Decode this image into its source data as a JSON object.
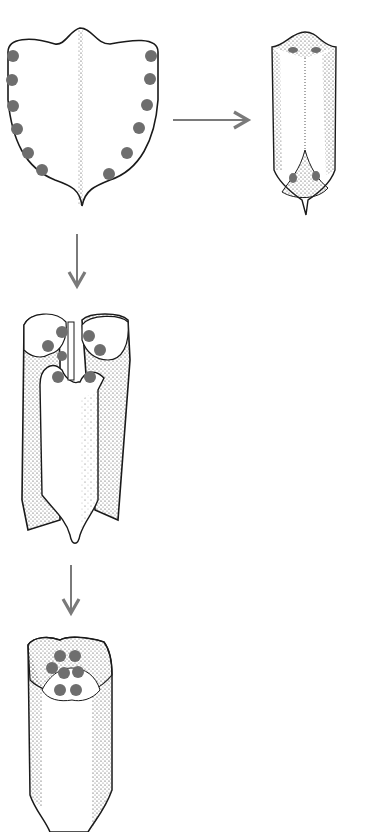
{
  "diagram": {
    "type": "process-illustration",
    "colors": {
      "background": "#ffffff",
      "outline": "#1a1a1a",
      "dot": "#6e6e6e",
      "arrow": "#7a7a7a",
      "stipple": "#333333"
    },
    "stages": [
      {
        "id": 1,
        "label": "",
        "shape": "flat shield-shaped blade with midrib",
        "dots": 12
      },
      {
        "id": 2,
        "label": "",
        "shape": "rolled tube, tip folded up",
        "dots": 4
      },
      {
        "id": 3,
        "label": "",
        "shape": "opened tube with inner lobe",
        "dots": 8
      },
      {
        "id": 4,
        "label": "",
        "shape": "closed tube with capped top",
        "dots": 7
      }
    ],
    "arrows": [
      {
        "from": 1,
        "to": 2,
        "direction": "right"
      },
      {
        "from": 1,
        "to": 3,
        "direction": "down"
      },
      {
        "from": 3,
        "to": 4,
        "direction": "down"
      }
    ]
  }
}
